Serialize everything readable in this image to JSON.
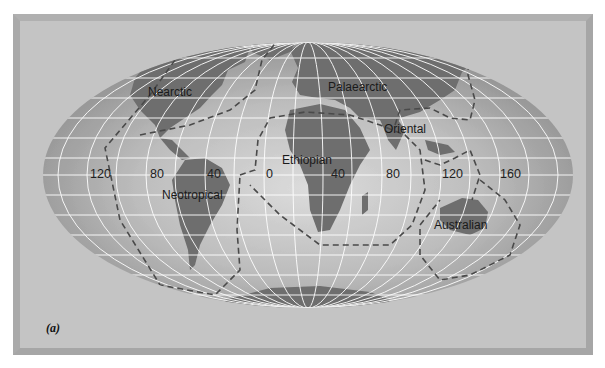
{
  "figure": {
    "panel_label": "(a)",
    "projection": "elliptical world map",
    "colors": {
      "background": "#ffffff",
      "frame": "#a6a6a6",
      "panel": "#c4c4c4",
      "ocean": "#9a9a9a",
      "ocean_light": "#d2d2d2",
      "land": "#6e6e6e",
      "graticule": "#ffffff",
      "boundary": "#4a4a4a"
    }
  },
  "regions": [
    {
      "name": "Nearctic"
    },
    {
      "name": "Palaearctic"
    },
    {
      "name": "Oriental"
    },
    {
      "name": "Ethiopian"
    },
    {
      "name": "Neotropical"
    },
    {
      "name": "Australian"
    }
  ],
  "longitude_labels": [
    "120",
    "80",
    "40",
    "0",
    "40",
    "80",
    "120",
    "160"
  ]
}
